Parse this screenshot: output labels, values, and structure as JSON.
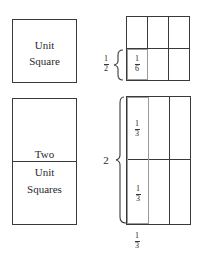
{
  "left_panel": {
    "unit_square": {
      "line1": "Unit",
      "line2": "Square"
    },
    "two_unit_squares": {
      "line1": "Two",
      "line2": "Unit",
      "line3": "Squares"
    }
  },
  "right_panel": {
    "top_grid": {
      "rows": 2,
      "cols": 3,
      "highlighted_cell": "bottom-left",
      "cell_fraction": {
        "num": "1",
        "den": "6"
      },
      "brace_fraction": {
        "num": "1",
        "den": "2"
      }
    },
    "bottom_grid": {
      "rows": 2,
      "cols": 3,
      "highlighted_column": "left",
      "cell_fraction_upper": {
        "num": "1",
        "den": "3"
      },
      "cell_fraction_lower": {
        "num": "1",
        "den": "3"
      },
      "brace_label": "2",
      "bottom_fraction": {
        "num": "1",
        "den": "3"
      }
    }
  },
  "colors": {
    "line": "#3a3a3a",
    "highlight_line": "#9a9a9a",
    "background": "#ffffff"
  }
}
